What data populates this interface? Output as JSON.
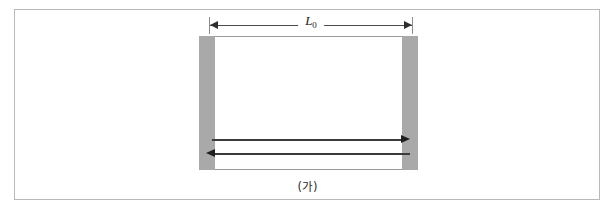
{
  "figure": {
    "caption": "(가)",
    "dimension": {
      "label_base": "L",
      "label_sub": "0",
      "name": "natural-length-L0"
    },
    "colors": {
      "bar_gray": "#a9a9a9",
      "outline": "#9a9a9a",
      "frame": "#b9b9b9",
      "arrow": "#1f1f1f",
      "dimension_line": "#4a4a4a"
    },
    "elements": {
      "left_bar_label": "left support bar",
      "right_bar_label": "right support bar",
      "body_label": "elastic body",
      "upper_arrow_label": "force arrow pointing right",
      "lower_arrow_label": "force arrow pointing left"
    }
  }
}
